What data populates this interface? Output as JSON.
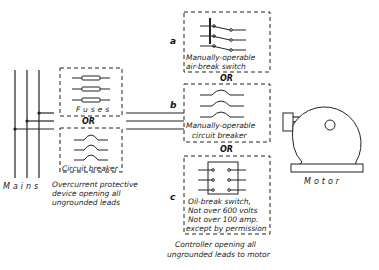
{
  "diagram": {
    "mains_label": "Mains",
    "motor_label": "Motor",
    "left_group": {
      "fuses_label": "Fuses",
      "or_label": "OR",
      "breaker_label": "Circuit breaker",
      "caption": [
        "Overcurrent protective",
        "device opening all",
        "ungrounded leads"
      ]
    },
    "options": [
      {
        "letter": "a",
        "caption": [
          "Manually-operable",
          "air-break switch"
        ]
      },
      {
        "letter": "b",
        "caption": [
          "Manually-operable",
          "circuit breaker"
        ]
      },
      {
        "letter": "c",
        "caption": [
          "Oil-break switch,",
          "Not over 600 volts",
          "Not over 100 amp.",
          "except by permission"
        ]
      }
    ],
    "or_a_b": "OR",
    "or_b_c": "OR",
    "controller_caption": [
      "Controller opening all",
      "ungrounded leads to motor"
    ]
  }
}
